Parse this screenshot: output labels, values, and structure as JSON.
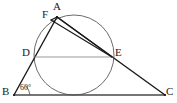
{
  "figure": {
    "kind": "euclidean-geometry-diagram",
    "background_color": "#ffffff",
    "stroke_color": "#1a1a1a",
    "circle_color": "#5a5a5a",
    "chord_color": "#8a8a8a"
  },
  "points": [
    {
      "id": "A",
      "label": "A",
      "x": 57,
      "y": 17
    },
    {
      "id": "F",
      "label": "F",
      "x": 52,
      "y": 20
    },
    {
      "id": "D",
      "label": "D",
      "x": 35,
      "y": 57
    },
    {
      "id": "E",
      "label": "E",
      "x": 112,
      "y": 57
    },
    {
      "id": "B",
      "label": "B",
      "x": 14,
      "y": 95
    },
    {
      "id": "C",
      "label": "C",
      "x": 165,
      "y": 95
    }
  ],
  "labels": [
    {
      "name": "label-A",
      "text": "A",
      "left": 53,
      "top": 2
    },
    {
      "name": "label-F",
      "text": "F",
      "left": 43,
      "top": 10
    },
    {
      "name": "label-D",
      "text": "D",
      "left": 23,
      "top": 48
    },
    {
      "name": "label-E",
      "text": "E",
      "left": 115,
      "top": 48
    },
    {
      "name": "label-B",
      "text": "B",
      "left": 2,
      "top": 86
    },
    {
      "name": "label-C",
      "text": "C",
      "left": 166,
      "top": 86
    }
  ],
  "angles": [
    {
      "name": "angle-B",
      "vertex": "B",
      "text": "60°",
      "left": 19,
      "top": 83
    }
  ],
  "circle": {
    "name": "inscribed-circle",
    "center_x": 74,
    "center_y": 55,
    "radius": 40
  },
  "segments": [
    {
      "name": "segment-BC",
      "from": "B",
      "to": "C",
      "style": "solid",
      "weight": 1.3
    },
    {
      "name": "segment-BA",
      "from": "B",
      "to": "A",
      "style": "solid",
      "weight": 1.3
    },
    {
      "name": "segment-AC",
      "from": "A",
      "to": "C",
      "style": "solid",
      "weight": 1.3
    },
    {
      "name": "segment-AE",
      "from": "A",
      "to": "E",
      "style": "solid",
      "weight": 1.2
    },
    {
      "name": "segment-FE",
      "from": "F",
      "to": "E",
      "style": "solid",
      "weight": 1.2
    },
    {
      "name": "segment-AF",
      "from": "A",
      "to": "F",
      "style": "solid",
      "weight": 1.2
    },
    {
      "name": "chord-DE",
      "from": "D",
      "to": "E",
      "style": "solid",
      "weight": 1.2
    }
  ],
  "angle_arc": {
    "name": "angle-arc-B",
    "path": "M 28 95 A 14 14 0 0 0 25.5 87"
  }
}
